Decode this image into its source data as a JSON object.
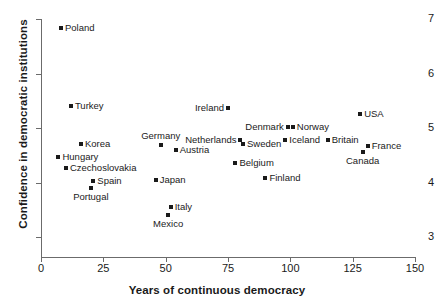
{
  "chart_data": {
    "type": "scatter",
    "title": "",
    "xlabel": "Years of continuous democracy",
    "ylabel": "Confidence in democratic institutions",
    "xlim": [
      0,
      150
    ],
    "ylim": [
      3,
      7
    ],
    "xticks": [
      0,
      25,
      50,
      75,
      100,
      125,
      150
    ],
    "yticks": [
      3,
      4,
      5,
      6,
      7
    ],
    "grid": false,
    "legend": null,
    "marker_color": "#1a1a1a",
    "axis_color": "#6b6b6b",
    "points": [
      {
        "label": "Poland",
        "x": 8,
        "y": 6.84,
        "label_pos": "right"
      },
      {
        "label": "Turkey",
        "x": 12,
        "y": 5.4,
        "label_pos": "right"
      },
      {
        "label": "Korea",
        "x": 16,
        "y": 4.71,
        "label_pos": "right"
      },
      {
        "label": "Hungary",
        "x": 7,
        "y": 4.47,
        "label_pos": "right"
      },
      {
        "label": "Czechoslovakia",
        "x": 10,
        "y": 4.27,
        "label_pos": "right"
      },
      {
        "label": "Spain",
        "x": 21,
        "y": 4.03,
        "label_pos": "right"
      },
      {
        "label": "Portugal",
        "x": 20,
        "y": 3.9,
        "label_pos": "below"
      },
      {
        "label": "Japan",
        "x": 46,
        "y": 4.05,
        "label_pos": "right"
      },
      {
        "label": "Germany",
        "x": 48,
        "y": 4.69,
        "label_pos": "above"
      },
      {
        "label": "Austria",
        "x": 54,
        "y": 4.6,
        "label_pos": "right"
      },
      {
        "label": "Italy",
        "x": 52,
        "y": 3.55,
        "label_pos": "right"
      },
      {
        "label": "Mexico",
        "x": 51,
        "y": 3.4,
        "label_pos": "below"
      },
      {
        "label": "Ireland",
        "x": 75,
        "y": 5.37,
        "label_pos": "left"
      },
      {
        "label": "Netherlands",
        "x": 80,
        "y": 4.78,
        "label_pos": "left"
      },
      {
        "label": "Sweden",
        "x": 81,
        "y": 4.71,
        "label_pos": "right"
      },
      {
        "label": "Belgium",
        "x": 78,
        "y": 4.36,
        "label_pos": "right"
      },
      {
        "label": "Finland",
        "x": 90,
        "y": 4.08,
        "label_pos": "right"
      },
      {
        "label": "Denmark",
        "x": 99,
        "y": 5.02,
        "label_pos": "left"
      },
      {
        "label": "Norway",
        "x": 101,
        "y": 5.02,
        "label_pos": "right"
      },
      {
        "label": "Iceland",
        "x": 98,
        "y": 4.78,
        "label_pos": "right"
      },
      {
        "label": "Britain",
        "x": 115,
        "y": 4.78,
        "label_pos": "right"
      },
      {
        "label": "USA",
        "x": 128,
        "y": 5.26,
        "label_pos": "right"
      },
      {
        "label": "France",
        "x": 131,
        "y": 4.67,
        "label_pos": "right"
      },
      {
        "label": "Canada",
        "x": 129,
        "y": 4.56,
        "label_pos": "below"
      }
    ]
  }
}
